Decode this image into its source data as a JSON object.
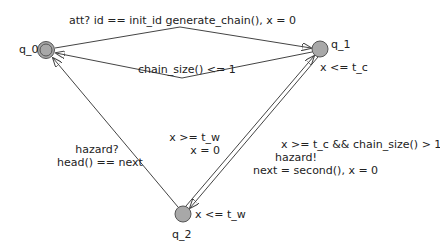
{
  "diagram": {
    "type": "timed-automaton",
    "colors": {
      "state_fill": "#a8a8a8",
      "state_stroke": "#555555",
      "edge": "#444444",
      "text": "#222222"
    },
    "states": [
      {
        "id": "q_0",
        "label": "q_0",
        "initial": true,
        "invariant": ""
      },
      {
        "id": "q_1",
        "label": "q_1",
        "initial": false,
        "invariant": "x <= t_c"
      },
      {
        "id": "q_2",
        "label": "q_2",
        "initial": false,
        "invariant": "x <= t_w"
      }
    ],
    "edges": [
      {
        "from": "q_0",
        "to": "q_1",
        "sync": "att?",
        "guard": "id == init_id",
        "update": "generate_chain(), x = 0",
        "label": "att? id == init_id  generate_chain(), x = 0"
      },
      {
        "from": "q_1",
        "to": "q_0",
        "guard": "chain_size() <= 1",
        "label": "chain_size() <= 1"
      },
      {
        "from": "q_2",
        "to": "q_0",
        "sync": "hazard?",
        "guard": "head() == next",
        "line1": "hazard?",
        "line2": "head() == next"
      },
      {
        "from": "q_2",
        "to": "q_1",
        "guard": "x >= t_w",
        "update": "x = 0",
        "line1": "x >= t_w",
        "line2": "x = 0"
      },
      {
        "from": "q_1",
        "to": "q_2",
        "guard": "x >= t_c && chain_size() > 1",
        "sync": "hazard!",
        "update": "next = second(), x = 0",
        "line1": "x >= t_c && chain_size() > 1",
        "line2": "hazard!",
        "line3": "next = second(), x = 0"
      }
    ]
  }
}
